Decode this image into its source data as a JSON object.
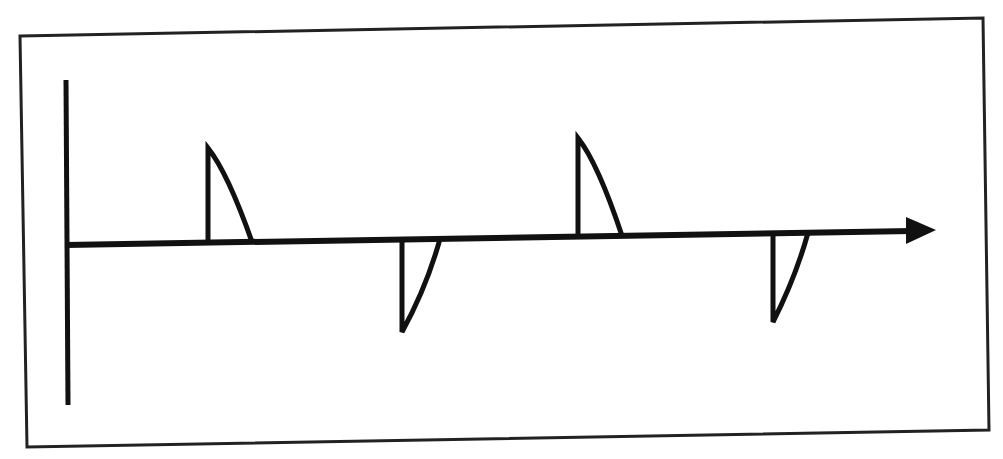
{
  "diagram": {
    "colors": {
      "stroke": "#111111",
      "frame": "#222222",
      "background": "#ffffff"
    },
    "frame": {
      "points": [
        [
          20,
          36
        ],
        [
          983,
          18
        ],
        [
          989,
          430
        ],
        [
          27,
          447
        ]
      ]
    },
    "baseline": {
      "x1": 66,
      "y1": 80,
      "x2": 68,
      "y2": 405
    },
    "axis": {
      "x1": 66,
      "y1": 245,
      "x2": 912,
      "y2": 231,
      "arrowhead": "right"
    },
    "fins": [
      {
        "id": "fin-1",
        "direction": "up",
        "base_x": 208,
        "top_y": 148,
        "tip_x": 252
      },
      {
        "id": "fin-2",
        "direction": "down",
        "base_x": 402,
        "bottom_y": 332,
        "tip_x": 440
      },
      {
        "id": "fin-3",
        "direction": "up",
        "base_x": 578,
        "top_y": 138,
        "tip_x": 622
      },
      {
        "id": "fin-4",
        "direction": "down",
        "base_x": 773,
        "bottom_y": 322,
        "tip_x": 808
      }
    ]
  }
}
